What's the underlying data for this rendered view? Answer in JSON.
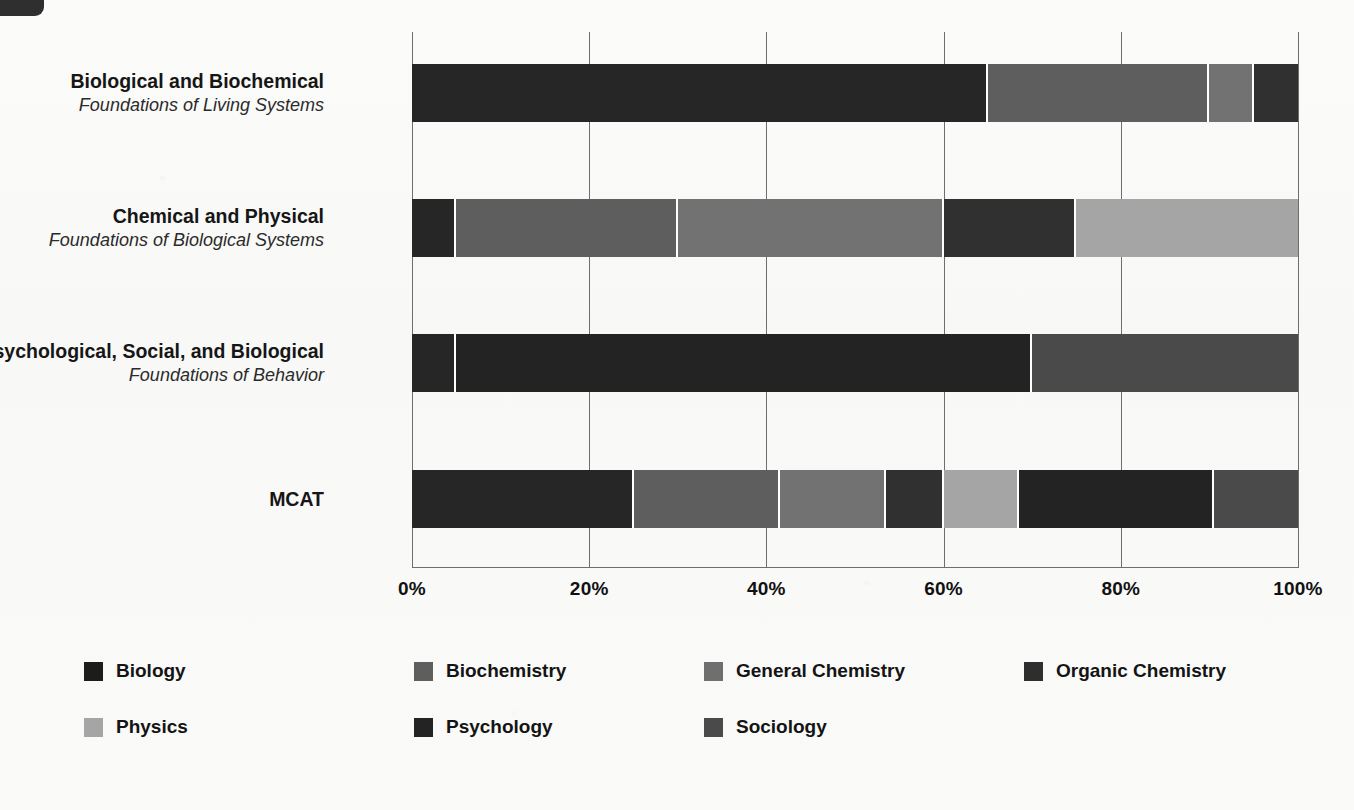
{
  "chart_data": {
    "type": "bar",
    "subtype": "horizontal-stacked-100",
    "title": "",
    "xlabel": "",
    "ylabel": "",
    "xlim": [
      0,
      100
    ],
    "xticks": [
      "0%",
      "20%",
      "40%",
      "60%",
      "80%",
      "100%"
    ],
    "xtick_values": [
      0,
      20,
      40,
      60,
      80,
      100
    ],
    "grid": true,
    "legend_position": "bottom",
    "categories": [
      {
        "main": "Biological and Biochemical",
        "sub": "Foundations of Living Systems"
      },
      {
        "main": "Chemical and Physical",
        "sub": "Foundations of Biological Systems"
      },
      {
        "main": "Psychological, Social, and Biological",
        "sub": "Foundations of Behavior"
      },
      {
        "main": "MCAT",
        "sub": ""
      }
    ],
    "series": [
      {
        "name": "Biology",
        "color": "#262626",
        "values": [
          65,
          5,
          5,
          25
        ]
      },
      {
        "name": "Biochemistry",
        "color": "#5e5e5e",
        "values": [
          25,
          25,
          0,
          16.5
        ]
      },
      {
        "name": "General Chemistry",
        "color": "#727272",
        "values": [
          5,
          30,
          0,
          12
        ]
      },
      {
        "name": "Organic Chemistry",
        "color": "#303030",
        "values": [
          5,
          15,
          0,
          6.5
        ]
      },
      {
        "name": "Physics",
        "color": "#a5a5a5",
        "values": [
          0,
          25,
          0,
          8.5
        ]
      },
      {
        "name": "Psychology",
        "color": "#232323",
        "values": [
          0,
          0,
          65,
          22
        ]
      },
      {
        "name": "Sociology",
        "color": "#4a4a4a",
        "values": [
          0,
          0,
          30,
          9.5
        ]
      }
    ]
  },
  "legend": {
    "items": [
      {
        "label": "Biology",
        "color": "#1c1c1c"
      },
      {
        "label": "Biochemistry",
        "color": "#5e5e5e"
      },
      {
        "label": "General Chemistry",
        "color": "#6f6f6f"
      },
      {
        "label": "Organic Chemistry",
        "color": "#2e2e2e"
      },
      {
        "label": "Physics",
        "color": "#a5a5a5"
      },
      {
        "label": "Psychology",
        "color": "#232323"
      },
      {
        "label": "Sociology",
        "color": "#4a4a4a"
      }
    ]
  }
}
